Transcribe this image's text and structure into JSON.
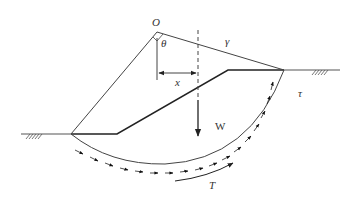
{
  "diagram": {
    "labels": {
      "center": "O",
      "angle": "θ",
      "unit_weight": "γ",
      "moment_arm": "x",
      "weight": "W",
      "shear_stress": "τ",
      "shear_force": "T"
    },
    "colors": {
      "line": "#333333",
      "slope": "#222222",
      "background": "#ffffff"
    },
    "points": {
      "center_O": [
        157,
        32
      ],
      "toe": [
        71,
        134
      ],
      "slope_bottom": [
        117,
        134
      ],
      "crest": [
        228,
        70
      ],
      "arc_exit": [
        284,
        70
      ],
      "ground_left_start": [
        21,
        134
      ],
      "ground_right_end": [
        340,
        70
      ]
    }
  }
}
